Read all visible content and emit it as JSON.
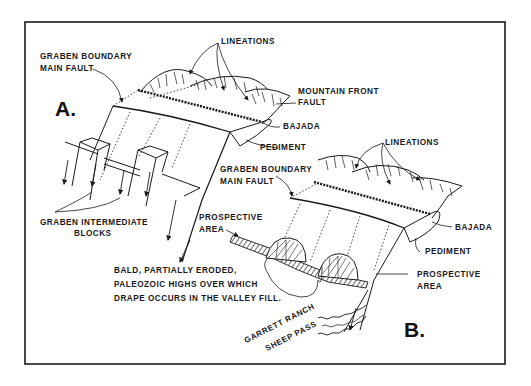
{
  "figure": {
    "panel_a": {
      "letter": "A.",
      "labels": {
        "lineations": "LINEATIONS",
        "graben_boundary_line1": "GRABEN BOUNDARY",
        "graben_boundary_line2": "MAIN FAULT",
        "mountain_front_line1": "MOUNTAIN FRONT",
        "mountain_front_line2": "FAULT",
        "bajada": "BAJADA",
        "pediment": "PEDIMENT",
        "graben_intermediate_line1": "GRABEN INTERMEDIATE",
        "graben_intermediate_line2": "BLOCKS"
      }
    },
    "panel_b": {
      "letter": "B.",
      "labels": {
        "lineations": "LINEATIONS",
        "graben_boundary_line1": "GRABEN BOUNDARY",
        "graben_boundary_line2": "MAIN FAULT",
        "bajada": "BAJADA",
        "pediment": "PEDIMENT",
        "prospective_area_left_line1": "PROSPECTIVE",
        "prospective_area_left_line2": "AREA",
        "prospective_area_right_line1": "PROSPECTIVE",
        "prospective_area_right_line2": "AREA",
        "bald_highs_line1": "BALD, PARTIALLY ERODED,",
        "bald_highs_line2": "PALEOZOIC HIGHS OVER WHICH",
        "bald_highs_line3": "DRAPE OCCURS IN THE VALLEY FILL.",
        "garrett_ranch": "GARRETT RANCH",
        "sheep_pass": "SHEEP PASS"
      }
    },
    "colors": {
      "ink": "#1a1a1a",
      "background": "#ffffff"
    }
  }
}
